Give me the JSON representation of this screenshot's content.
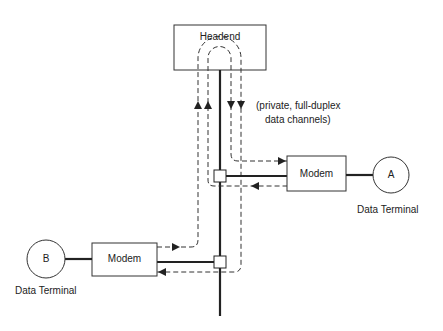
{
  "diagram": {
    "headend": {
      "label": "Headend"
    },
    "annotation": {
      "line1": "(private, full-duplex",
      "line2": "data channels)"
    },
    "modem_a": {
      "label": "Modem"
    },
    "modem_b": {
      "label": "Modem"
    },
    "terminal_a": {
      "letter": "A",
      "caption": "Data Terminal"
    },
    "terminal_b": {
      "letter": "B",
      "caption": "Data Terminal"
    },
    "colors": {
      "line": "#222222",
      "background": "#ffffff"
    }
  }
}
